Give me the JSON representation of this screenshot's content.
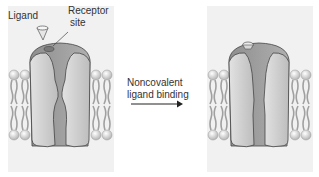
{
  "labels": {
    "ligand": "Ligand",
    "receptor_line1": "Receptor",
    "receptor_line2": "site",
    "arrow_line1": "Noncovalent",
    "arrow_line2": "ligand binding"
  },
  "panels": [
    {
      "name": "unbound-state",
      "ligand_bound": false
    },
    {
      "name": "bound-state",
      "ligand_bound": true
    }
  ],
  "colors": {
    "background": "#ffffff",
    "panel": "#f1f1f1",
    "protein_light": "#cfcfcf",
    "protein_dark": "#9a9a9a",
    "lipid": "#a8a8a8"
  }
}
